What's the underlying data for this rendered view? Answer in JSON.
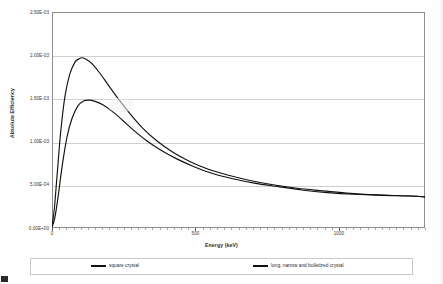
{
  "chart_data": {
    "type": "line",
    "title": "",
    "xlabel": "Energy (keV)",
    "ylabel": "Absolute Efficiency",
    "xlim": [
      0,
      1300
    ],
    "ylim": [
      0,
      0.0025
    ],
    "grid": true,
    "legend_position": "bottom",
    "xticks": [
      {
        "value": 0,
        "label": "0"
      },
      {
        "value": 500,
        "label": "500"
      },
      {
        "value": 1000,
        "label": "1000"
      }
    ],
    "yticks": [
      {
        "value": 0.0,
        "label": "0.00E+00"
      },
      {
        "value": 0.0005,
        "label": "5.00E-04"
      },
      {
        "value": 0.001,
        "label": "1.00E-03"
      },
      {
        "value": 0.0015,
        "label": "1.50E-03"
      },
      {
        "value": 0.002,
        "label": "2.00E-03"
      },
      {
        "value": 0.0025,
        "label": "2.50E-03"
      }
    ],
    "series": [
      {
        "name": "square crystal",
        "color": "#111111",
        "peak_x": 105,
        "peak_y": 0.00197,
        "x": [
          0,
          8,
          18,
          30,
          45,
          62,
          80,
          95,
          105,
          120,
          140,
          165,
          195,
          230,
          270,
          315,
          365,
          420,
          480,
          545,
          615,
          690,
          770,
          855,
          945,
          1040,
          1140,
          1245,
          1300
        ],
        "y": [
          2e-05,
          0.00022,
          0.00062,
          0.0011,
          0.00152,
          0.00178,
          0.00192,
          0.00196,
          0.00197,
          0.00195,
          0.0019,
          0.0018,
          0.00166,
          0.0015,
          0.00133,
          0.00116,
          0.00101,
          0.00088,
          0.00077,
          0.00068,
          0.00061,
          0.00055,
          0.0005,
          0.00046,
          0.00043,
          0.0004,
          0.00038,
          0.00037,
          0.00036
        ]
      },
      {
        "name": "long, narrow and bulletized crystal",
        "color": "#111111",
        "peak_x": 132,
        "peak_y": 0.00148,
        "x": [
          0,
          10,
          22,
          36,
          52,
          70,
          90,
          110,
          132,
          155,
          180,
          210,
          245,
          285,
          330,
          380,
          435,
          495,
          560,
          630,
          705,
          785,
          870,
          960,
          1055,
          1155,
          1255,
          1300
        ],
        "y": [
          1e-05,
          0.00012,
          0.00038,
          0.00073,
          0.00105,
          0.00127,
          0.00141,
          0.00147,
          0.00148,
          0.00146,
          0.00142,
          0.00135,
          0.00125,
          0.00113,
          0.00101,
          0.0009,
          0.0008,
          0.00071,
          0.00063,
          0.00057,
          0.00052,
          0.00048,
          0.00044,
          0.00041,
          0.00039,
          0.00038,
          0.00037,
          0.00036
        ]
      }
    ]
  },
  "legend": {
    "entries": [
      {
        "label": "square crystal"
      },
      {
        "label": "long, narrow and bulletized crystal"
      }
    ]
  }
}
